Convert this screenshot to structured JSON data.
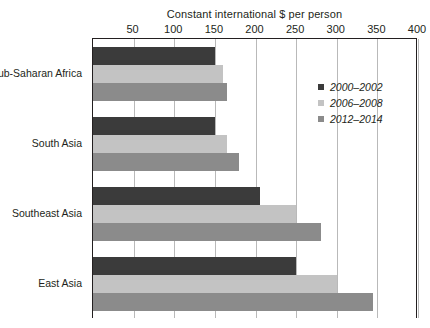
{
  "chart_data": {
    "type": "bar",
    "orientation": "horizontal",
    "title": "",
    "xlabel": "Constant international $ per person",
    "ylabel": "",
    "xlim": [
      0,
      400
    ],
    "xticks": [
      50,
      100,
      150,
      200,
      250,
      300,
      350,
      400
    ],
    "grid": true,
    "legend_position": "inside-right",
    "categories": [
      "Sub-Saharan Africa",
      "South Asia",
      "Southeast Asia",
      "East Asia"
    ],
    "series": [
      {
        "name": "2000–2002",
        "color": "#3b3b3b",
        "values": [
          150,
          150,
          205,
          250
        ]
      },
      {
        "name": "2006–2008",
        "color": "#c3c3c3",
        "values": [
          160,
          165,
          250,
          300
        ]
      },
      {
        "name": "2012–2014",
        "color": "#8b8b8b",
        "values": [
          165,
          180,
          280,
          345
        ]
      }
    ]
  },
  "axis": {
    "title": "Constant international $ per person"
  },
  "colors": {
    "axis_line": "#231f20",
    "gridline": "#b9b9b9",
    "text": "#231f20",
    "background": "#ffffff"
  }
}
